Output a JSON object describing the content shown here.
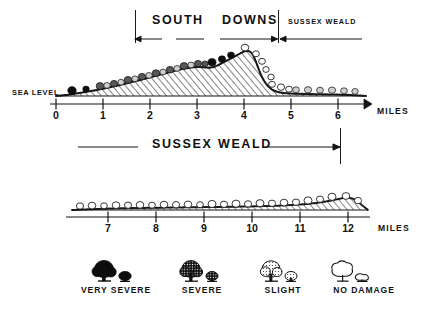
{
  "figure": {
    "title_upper_band": [
      "SOUTH",
      "DOWNS"
    ],
    "title_upper_right": "SUSSEX  WEALD",
    "title_middle_band": [
      "SUSSEX",
      "WEALD"
    ],
    "sea_level_label": "SEA LEVEL",
    "miles_label_upper": "MILES",
    "miles_label_lower": "MILES",
    "ink_color": "#141414",
    "paper_color": "#ffffff"
  },
  "upper_profile": {
    "axis": {
      "ticks": [
        "0",
        "1",
        "2",
        "3",
        "4",
        "5",
        "6"
      ],
      "unit": "MILES",
      "tick_spacing_px": 47,
      "x_start_px": 56
    },
    "baseline_label": "SEA LEVEL",
    "terrain": {
      "description": "South Downs chalk escarpment profile rising from sea level at mile 0 to a crest near mile 3.8, then falling steeply to the low Sussex Weald plain by mile 4.6",
      "points_miles_height": [
        [
          0.0,
          0.0
        ],
        [
          0.4,
          2.0
        ],
        [
          0.8,
          3.5
        ],
        [
          1.2,
          5.0
        ],
        [
          1.6,
          7.0
        ],
        [
          2.0,
          9.0
        ],
        [
          2.4,
          11.0
        ],
        [
          2.8,
          13.5
        ],
        [
          3.0,
          14.5
        ],
        [
          3.2,
          14.0
        ],
        [
          3.4,
          15.5
        ],
        [
          3.6,
          18.5
        ],
        [
          3.8,
          24.0
        ],
        [
          3.9,
          22.0
        ],
        [
          4.0,
          17.0
        ],
        [
          4.2,
          9.0
        ],
        [
          4.4,
          4.5
        ],
        [
          4.7,
          2.5
        ],
        [
          5.2,
          2.0
        ],
        [
          5.8,
          2.0
        ],
        [
          6.3,
          1.5
        ],
        [
          6.6,
          0.0
        ]
      ],
      "crest_mile": 3.8,
      "max_height_units": 24
    },
    "damage_sequence": [
      {
        "mile": 0.35,
        "damage": "very-severe"
      },
      {
        "mile": 0.6,
        "damage": "very-severe"
      },
      {
        "mile": 0.9,
        "damage": "severe"
      },
      {
        "mile": 1.15,
        "damage": "slight"
      },
      {
        "mile": 1.4,
        "damage": "severe"
      },
      {
        "mile": 1.65,
        "damage": "slight"
      },
      {
        "mile": 1.9,
        "damage": "severe"
      },
      {
        "mile": 2.15,
        "damage": "severe"
      },
      {
        "mile": 2.4,
        "damage": "severe"
      },
      {
        "mile": 2.65,
        "damage": "severe"
      },
      {
        "mile": 2.9,
        "damage": "severe"
      },
      {
        "mile": 3.15,
        "damage": "severe"
      },
      {
        "mile": 3.4,
        "damage": "very-severe"
      },
      {
        "mile": 3.62,
        "damage": "very-severe"
      },
      {
        "mile": 3.8,
        "damage": "no-damage"
      },
      {
        "mile": 4.0,
        "damage": "no-damage"
      },
      {
        "mile": 4.25,
        "damage": "no-damage"
      },
      {
        "mile": 4.5,
        "damage": "no-damage"
      },
      {
        "mile": 4.75,
        "damage": "no-damage"
      },
      {
        "mile": 5.05,
        "damage": "slight"
      },
      {
        "mile": 5.35,
        "damage": "slight"
      },
      {
        "mile": 5.65,
        "damage": "slight"
      },
      {
        "mile": 5.95,
        "damage": "slight"
      },
      {
        "mile": 6.2,
        "damage": "slight"
      }
    ]
  },
  "middle_band": {
    "left_rule": true,
    "label_left": "SUSSEX",
    "label_right": "WEALD",
    "arrow_right": true
  },
  "lower_profile": {
    "axis": {
      "ticks": [
        "7",
        "8",
        "9",
        "10",
        "11",
        "12"
      ],
      "unit": "MILES",
      "tick_spacing_px": 47,
      "x_start_px": 108
    },
    "terrain": {
      "description": "Low, almost flat Sussex Weald plain from mile 6.5 to 12.5 with a slight rise toward mile 12",
      "points_miles_height": [
        [
          6.5,
          0.0
        ],
        [
          7.0,
          1.5
        ],
        [
          7.5,
          1.8
        ],
        [
          8.0,
          1.8
        ],
        [
          8.5,
          2.0
        ],
        [
          9.0,
          2.0
        ],
        [
          9.5,
          2.2
        ],
        [
          10.0,
          2.4
        ],
        [
          10.5,
          2.8
        ],
        [
          11.0,
          3.2
        ],
        [
          11.4,
          4.2
        ],
        [
          11.8,
          6.0
        ],
        [
          12.1,
          7.0
        ],
        [
          12.4,
          4.0
        ],
        [
          12.7,
          0.0
        ]
      ],
      "max_height_units": 7
    },
    "damage_sequence": [
      {
        "mile": 6.7,
        "damage": "no-damage"
      },
      {
        "mile": 6.95,
        "damage": "no-damage"
      },
      {
        "mile": 7.2,
        "damage": "no-damage"
      },
      {
        "mile": 7.45,
        "damage": "no-damage"
      },
      {
        "mile": 7.7,
        "damage": "no-damage"
      },
      {
        "mile": 7.95,
        "damage": "no-damage"
      },
      {
        "mile": 8.2,
        "damage": "no-damage"
      },
      {
        "mile": 8.45,
        "damage": "no-damage"
      },
      {
        "mile": 8.7,
        "damage": "no-damage"
      },
      {
        "mile": 8.95,
        "damage": "no-damage"
      },
      {
        "mile": 9.2,
        "damage": "no-damage"
      },
      {
        "mile": 9.45,
        "damage": "no-damage"
      },
      {
        "mile": 9.7,
        "damage": "no-damage"
      },
      {
        "mile": 9.95,
        "damage": "no-damage"
      },
      {
        "mile": 10.2,
        "damage": "no-damage"
      },
      {
        "mile": 10.45,
        "damage": "no-damage"
      },
      {
        "mile": 10.7,
        "damage": "no-damage"
      },
      {
        "mile": 10.95,
        "damage": "no-damage"
      },
      {
        "mile": 11.2,
        "damage": "no-damage"
      },
      {
        "mile": 11.45,
        "damage": "no-damage"
      },
      {
        "mile": 11.7,
        "damage": "no-damage"
      },
      {
        "mile": 11.95,
        "damage": "no-damage"
      },
      {
        "mile": 12.25,
        "damage": "no-damage"
      }
    ]
  },
  "legend": {
    "items": [
      {
        "key": "very-severe",
        "label": "VERY  SEVERE",
        "icon": "tree-solid-icon",
        "fill": "#101010"
      },
      {
        "key": "severe",
        "label": "SEVERE",
        "icon": "tree-dark-stipple-icon",
        "fill": "#3a3a3a"
      },
      {
        "key": "slight",
        "label": "SLIGHT",
        "icon": "tree-light-stipple-icon",
        "fill": "#bdbdbd"
      },
      {
        "key": "no-damage",
        "label": "NO DAMAGE",
        "icon": "tree-outline-icon",
        "fill": "#ffffff"
      }
    ]
  }
}
